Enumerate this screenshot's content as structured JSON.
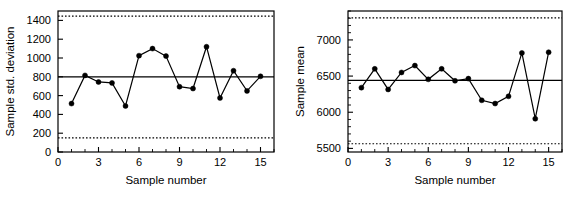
{
  "figure": {
    "background": "#ffffff",
    "ink": "#000000",
    "panels": [
      "std-deviation-chart",
      "mean-chart"
    ]
  },
  "chart_data": [
    {
      "id": "s-chart",
      "type": "line",
      "title": "",
      "xlabel": "Sample number",
      "ylabel": "Sample std. deviation",
      "x": [
        1,
        2,
        3,
        4,
        5,
        6,
        7,
        8,
        9,
        10,
        11,
        12,
        13,
        14,
        15
      ],
      "values": [
        515,
        815,
        745,
        735,
        490,
        1025,
        1100,
        1020,
        695,
        675,
        1120,
        575,
        865,
        650,
        805
      ],
      "xlim": [
        0,
        16
      ],
      "ylim": [
        0,
        1500
      ],
      "xticks": [
        0,
        3,
        6,
        9,
        12,
        15
      ],
      "xtick_labels": [
        "0",
        "3",
        "6",
        "9",
        "12",
        "15"
      ],
      "xminor_step": 1,
      "yticks": [
        0,
        200,
        400,
        600,
        800,
        1000,
        1200,
        1400
      ],
      "ytick_labels": [
        "0",
        "200",
        "400",
        "600",
        "800",
        "1000",
        "1200",
        "1400"
      ],
      "center_line": 800,
      "upper_limit": 1445,
      "lower_limit": 150,
      "grid": false,
      "legend": "none",
      "marker": "filled-circle",
      "line_style": "solid",
      "limit_style": "dotted"
    },
    {
      "id": "xbar-chart",
      "type": "line",
      "title": "",
      "xlabel": "Sample number",
      "ylabel": "Sample mean",
      "x": [
        1,
        2,
        3,
        4,
        5,
        6,
        7,
        8,
        9,
        10,
        11,
        12,
        13,
        14,
        15
      ],
      "values": [
        6340,
        6600,
        6315,
        6550,
        6645,
        6455,
        6600,
        6435,
        6465,
        6165,
        6120,
        6220,
        6820,
        5910,
        6830
      ],
      "xlim": [
        0,
        16
      ],
      "ylim": [
        5450,
        7400
      ],
      "xticks": [
        0,
        3,
        6,
        9,
        12,
        15
      ],
      "xtick_labels": [
        "0",
        "3",
        "6",
        "9",
        "12",
        "15"
      ],
      "xminor_step": 1,
      "yticks": [
        5500,
        6000,
        6500,
        7000
      ],
      "ytick_labels": [
        "5500",
        "6000",
        "6500",
        "7000"
      ],
      "yminor_step": 100,
      "center_line": 6440,
      "upper_limit": 7305,
      "lower_limit": 5565,
      "grid": false,
      "legend": "none",
      "marker": "filled-circle",
      "line_style": "solid",
      "limit_style": "dotted"
    }
  ]
}
